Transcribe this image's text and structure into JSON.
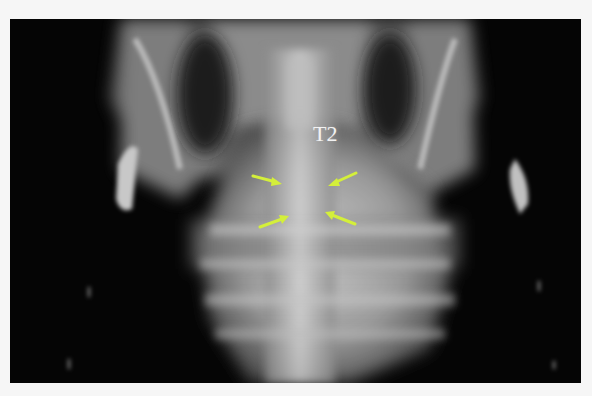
{
  "image": {
    "description": "Ventrodorsal radiograph of thoracic spine region",
    "background_color": "#050505",
    "frame_color": "#f6f6f6"
  },
  "annotations": {
    "vertebra_label": "T2",
    "label_color": "#f2f2f2",
    "arrow_color": "#d4ef3a",
    "arrows": [
      {
        "id": "top-left",
        "direction": "right-down"
      },
      {
        "id": "top-right",
        "direction": "left-down"
      },
      {
        "id": "bottom-left",
        "direction": "right-up"
      },
      {
        "id": "bottom-right",
        "direction": "left-up"
      }
    ]
  }
}
